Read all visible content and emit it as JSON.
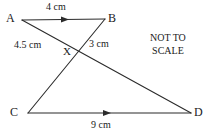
{
  "figure": {
    "kind": "intersecting-triangles-geometry-diagram",
    "note": "NOT TO SCALE",
    "note_lines": [
      "NOT TO",
      "SCALE"
    ],
    "stroke_color": "#2b2b2b",
    "text_color": "#1a1a1a",
    "background_color": "#ffffff",
    "vertices": [
      {
        "id": "A",
        "label": "A",
        "x": 22,
        "y": 20
      },
      {
        "id": "B",
        "label": "B",
        "x": 105,
        "y": 19
      },
      {
        "id": "C",
        "label": "C",
        "x": 28,
        "y": 113
      },
      {
        "id": "D",
        "label": "D",
        "x": 191,
        "y": 113
      },
      {
        "id": "X",
        "label": "X",
        "x": 77,
        "y": 52
      }
    ],
    "segments": [
      {
        "id": "AB",
        "from": "A",
        "to": "B",
        "arrow": true,
        "arrow_direction": "A-to-B"
      },
      {
        "id": "CD",
        "from": "C",
        "to": "D",
        "arrow": true,
        "arrow_direction": "C-to-D"
      },
      {
        "id": "AD",
        "from": "A",
        "to": "D",
        "arrow": false,
        "arrow_direction": "none"
      },
      {
        "id": "BC",
        "from": "B",
        "to": "C",
        "arrow": false,
        "arrow_direction": "none"
      }
    ],
    "measurements": [
      {
        "id": "AB",
        "segment": "AB",
        "text": "4 cm",
        "value": 4,
        "unit": "cm"
      },
      {
        "id": "AX",
        "segment": "AX",
        "text": "4.5 cm",
        "value": 4.5,
        "unit": "cm"
      },
      {
        "id": "BX",
        "segment": "BX",
        "text": "3 cm",
        "value": 3,
        "unit": "cm"
      },
      {
        "id": "CD",
        "segment": "CD",
        "text": "9 cm",
        "value": 9,
        "unit": "cm"
      }
    ]
  }
}
